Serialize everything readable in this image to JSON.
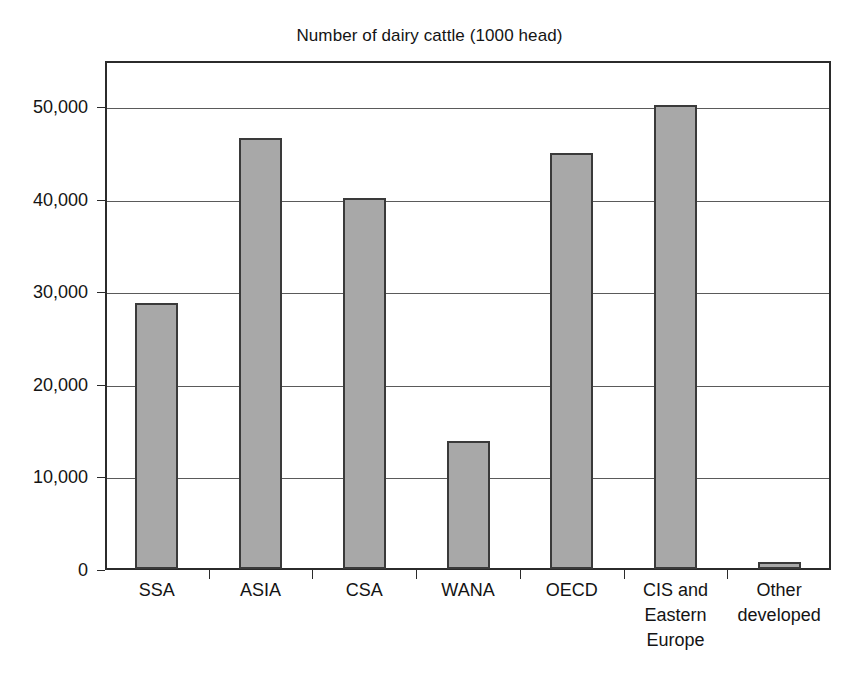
{
  "chart_data": {
    "type": "bar",
    "title": "Number of dairy cattle (1000 head)",
    "xlabel": "",
    "ylabel": "",
    "categories": [
      "SSA",
      "ASIA",
      "CSA",
      "WANA",
      "OECD",
      "CIS and Eastern Europe",
      "Other developed"
    ],
    "category_lines": [
      [
        "SSA"
      ],
      [
        "ASIA"
      ],
      [
        "CSA"
      ],
      [
        "WANA"
      ],
      [
        "OECD"
      ],
      [
        "CIS and",
        "Eastern",
        "Europe"
      ],
      [
        "Other",
        "developed"
      ]
    ],
    "values": [
      28700,
      46600,
      40100,
      13800,
      44900,
      50100,
      800
    ],
    "ylim": [
      0,
      55000
    ],
    "yticks": [
      0,
      10000,
      20000,
      30000,
      40000,
      50000
    ],
    "ytick_labels": [
      "0",
      "10,000",
      "20,000",
      "30,000",
      "40,000",
      "50,000"
    ],
    "grid": true,
    "legend": false,
    "bar_color": "#a8a8a8",
    "bar_edge_color": "#3a3a3a",
    "axis_color": "#2b2b2b",
    "grid_color": "#5a5a5a",
    "background_color": "#ffffff"
  }
}
